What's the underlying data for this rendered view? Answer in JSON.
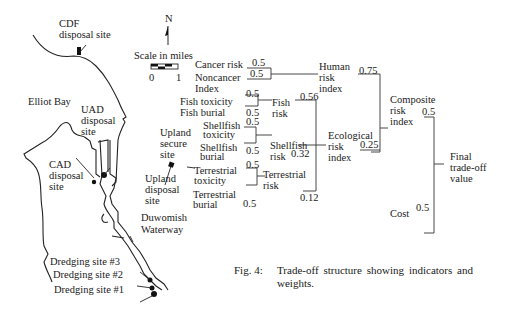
{
  "map": {
    "north_label": "N",
    "scale_title": "Scale in miles",
    "scale_ticks": [
      "0",
      "1"
    ],
    "labels": {
      "cdf": "CDF\ndisposal site",
      "elliot_bay": "Elliot Bay",
      "uad": "UAD\ndisposal\nsite",
      "cad": "CAD\ndisposal\nsite",
      "upland_secure": "Upland\nsecure\nsite",
      "upland_disposal": "Upland\ndisposal\nsite",
      "duwamish": "Duwomish\nWaterway",
      "dredge3": "Dredging site #3",
      "dredge2": "Dredging site #2",
      "dredge1": "Dredging site #1"
    }
  },
  "tree": {
    "leaves": {
      "cancer_risk": "Cancer risk",
      "noncancer_index": "Noncancer\nIndex",
      "fish_toxicity": "Fish toxicity",
      "fish_burial": "Fish burial",
      "shellfish_toxicity": "Shellfish\ntoxicity",
      "shellfish_burial": "Shellfish\nburial",
      "terrestrial_toxicity": "Terrestrial\ntoxicity",
      "terrestrial_burial": "Terrestrial\nburial",
      "cost": "Cost"
    },
    "nodes": {
      "human_risk_index": "Human\nrisk\nindex",
      "fish_risk": "Fish\nrisk",
      "shellfish_risk": "Shellfish\nrisk",
      "terrestrial_risk": "Terrestrial\nrisk",
      "ecological_risk_index": "Ecological\nrisk\nindex",
      "composite_risk_index": "Composite\nrisk\nindex",
      "final_tradeoff_value": "Final\ntrade-off\nvalue"
    },
    "weights": {
      "cancer_risk": "0.5",
      "noncancer_index": "0.5",
      "fish_toxicity": "0.5",
      "fish_burial": "0.5",
      "shellfish_toxicity": "0.5",
      "shellfish_burial": "0.5",
      "terrestrial_toxicity": "0.5",
      "terrestrial_burial": "0.5",
      "fish_risk": "0.56",
      "shellfish_risk": "0.32",
      "terrestrial_risk": "0.12",
      "human_risk_index": "0.75",
      "ecological_risk_index": "0.25",
      "composite_risk_index": "0.5",
      "cost": "0.5"
    }
  },
  "caption": {
    "label": "Fig. 4:",
    "text": "Trade-off structure showing indicators and weights."
  }
}
